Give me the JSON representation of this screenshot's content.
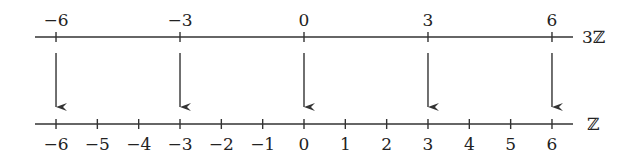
{
  "diagram": {
    "top_line": {
      "set_label": "3ℤ",
      "ticks": [
        {
          "value": -6,
          "label": "−6"
        },
        {
          "value": -3,
          "label": "−3"
        },
        {
          "value": 0,
          "label": "0"
        },
        {
          "value": 3,
          "label": "3"
        },
        {
          "value": 6,
          "label": "6"
        }
      ]
    },
    "bottom_line": {
      "set_label": "ℤ",
      "ticks": [
        {
          "value": -6,
          "label": "−6"
        },
        {
          "value": -5,
          "label": "−5"
        },
        {
          "value": -4,
          "label": "−4"
        },
        {
          "value": -3,
          "label": "−3"
        },
        {
          "value": -2,
          "label": "−2"
        },
        {
          "value": -1,
          "label": "−1"
        },
        {
          "value": 0,
          "label": "0"
        },
        {
          "value": 1,
          "label": "1"
        },
        {
          "value": 2,
          "label": "2"
        },
        {
          "value": 3,
          "label": "3"
        },
        {
          "value": 4,
          "label": "4"
        },
        {
          "value": 5,
          "label": "5"
        },
        {
          "value": 6,
          "label": "6"
        }
      ]
    },
    "arrows": [
      {
        "from": -6,
        "to": -6
      },
      {
        "from": -3,
        "to": -3
      },
      {
        "from": 0,
        "to": 0
      },
      {
        "from": 3,
        "to": 3
      },
      {
        "from": 6,
        "to": 6
      }
    ],
    "line_color": "#333333"
  }
}
